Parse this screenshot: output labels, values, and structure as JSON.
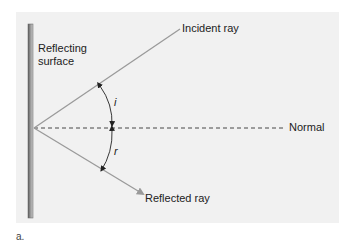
{
  "figure": {
    "panel_label": "a.",
    "surface_label_line1": "Reflecting",
    "surface_label_line2": "surface",
    "incident_label": "Incident ray",
    "normal_label": "Normal",
    "reflected_label": "Reflected ray",
    "angle_incidence": "i",
    "angle_reflection": "r"
  },
  "colors": {
    "background": "#f1f1f1",
    "ray": "#9a9a9a",
    "mirror": "#777777",
    "text": "#222222"
  }
}
